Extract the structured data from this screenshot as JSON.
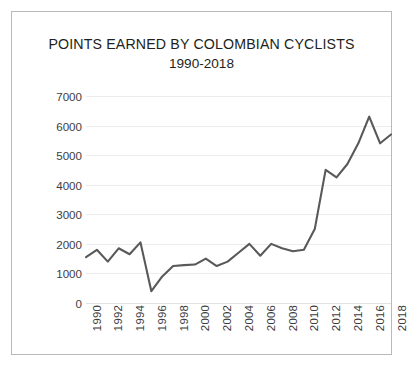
{
  "figure": {
    "title_main": "POINTS EARNED BY COLOMBIAN CYCLISTS",
    "title_sub": "1990-2018",
    "caption": "",
    "line_color": "#595959",
    "grid_color": "#ececec",
    "frame_color": "#b9b9b9",
    "text_color": "#231f20"
  },
  "chart_data": {
    "type": "line",
    "title": "POINTS EARNED BY COLOMBIAN CYCLISTS 1990-2018",
    "subtitle": "1990-2018",
    "xlabel": "",
    "ylabel": "",
    "ylim": [
      0,
      7000
    ],
    "xlim": [
      1990,
      2018
    ],
    "grid": true,
    "legend": false,
    "y_ticks": [
      0,
      1000,
      2000,
      3000,
      4000,
      5000,
      6000,
      7000
    ],
    "y_tick_labels": [
      "0",
      "1000",
      "2000",
      "3000",
      "4000",
      "5000",
      "6000",
      "7000"
    ],
    "x_tick_labels": [
      "1990",
      "1992",
      "1994",
      "1996",
      "1998",
      "2000",
      "2002",
      "2004",
      "2006",
      "2008",
      "2010",
      "2012",
      "2014",
      "2016",
      "2018"
    ],
    "x": [
      1990,
      1991,
      1992,
      1993,
      1994,
      1995,
      1996,
      1997,
      1998,
      1999,
      2000,
      2001,
      2002,
      2003,
      2004,
      2005,
      2006,
      2007,
      2008,
      2009,
      2010,
      2011,
      2012,
      2013,
      2014,
      2015,
      2016,
      2017,
      2018
    ],
    "values": [
      1550,
      1800,
      1400,
      1850,
      1650,
      2050,
      400,
      900,
      1250,
      1280,
      1300,
      1500,
      1250,
      1400,
      1700,
      2000,
      1600,
      2000,
      1850,
      1750,
      1800,
      2500,
      4500,
      4250,
      4700,
      5400,
      6300,
      5400,
      5700
    ],
    "series": [
      {
        "name": "Points earned",
        "values": [
          1550,
          1800,
          1400,
          1850,
          1650,
          2050,
          400,
          900,
          1250,
          1280,
          1300,
          1500,
          1250,
          1400,
          1700,
          2000,
          1600,
          2000,
          1850,
          1750,
          1800,
          2500,
          4500,
          4250,
          4700,
          5400,
          6300,
          5400,
          5700
        ]
      }
    ]
  }
}
